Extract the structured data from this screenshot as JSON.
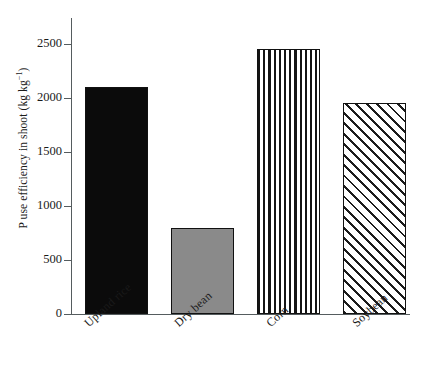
{
  "chart_data": {
    "type": "bar",
    "title": "",
    "subtitle": "",
    "xlabel": "",
    "ylabel": "P use efficiency in shoot (kg kg−1)",
    "ylabel_main": "P use efficiency in shoot (kg kg",
    "ylabel_sup": "−1",
    "ylabel_tail": ")",
    "categories": [
      "Upland rice",
      "Dry bean",
      "Corn",
      "Soybean"
    ],
    "values": [
      2100,
      800,
      2450,
      1950
    ],
    "ylim": [
      0,
      2700
    ],
    "yticks": [
      0,
      500,
      1000,
      1500,
      2000,
      2500
    ],
    "ytick_labels": [
      "0",
      "500",
      "1000",
      "1500",
      "2000",
      "2500"
    ],
    "grid": false,
    "legend": "none",
    "series": [
      {
        "name": "P use efficiency in shoot",
        "values": [
          2100,
          800,
          2450,
          1950
        ],
        "bar_styles": [
          "solid-black",
          "solid-gray",
          "vertical-lines",
          "diagonal-hatch"
        ]
      }
    ],
    "bars": [
      {
        "category": "Upland rice",
        "value": 2100,
        "fill": "solid-black",
        "fill_color": "#0b0b0b",
        "edge_color": "#111111"
      },
      {
        "category": "Dry bean",
        "value": 800,
        "fill": "solid-gray",
        "fill_color": "#8a8a8a",
        "edge_color": "#111111"
      },
      {
        "category": "Corn",
        "value": 2450,
        "fill": "vertical-lines",
        "fill_color": "#ffffff",
        "edge_color": "#111111"
      },
      {
        "category": "Soybean",
        "value": 1950,
        "fill": "diagonal-hatch",
        "fill_color": "#ffffff",
        "edge_color": "#111111"
      }
    ],
    "axis_color": "#555c5e"
  }
}
